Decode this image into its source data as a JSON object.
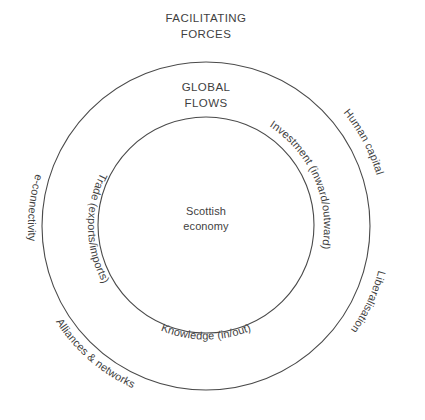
{
  "diagram": {
    "title_outer": {
      "line1": "FACILITATING",
      "line2": "FORCES"
    },
    "title_inner": {
      "line1": "GLOBAL",
      "line2": "FLOWS"
    },
    "center": {
      "line1": "Scottish",
      "line2": "economy"
    },
    "outer_ring_labels": [
      {
        "id": "e-connectivity",
        "text": "e-connectivity"
      },
      {
        "id": "human-capital",
        "text": "Human capital"
      },
      {
        "id": "liberalisation",
        "text": "Liberalisation"
      },
      {
        "id": "alliances-networks",
        "text": "Alliances & networks"
      }
    ],
    "inner_ring_labels": [
      {
        "id": "trade",
        "text": "Trade (exports/imports)"
      },
      {
        "id": "investment",
        "text": "Investment (inward/outward)"
      },
      {
        "id": "knowledge",
        "text": "Knowledge (in/out)"
      }
    ],
    "colors": {
      "stroke": "#4a4a4a",
      "text": "#3f3f3f",
      "background": "#ffffff"
    },
    "geometry": {
      "center_x": 206,
      "center_y": 226,
      "outer_radius": 164,
      "inner_radius": 108
    }
  }
}
